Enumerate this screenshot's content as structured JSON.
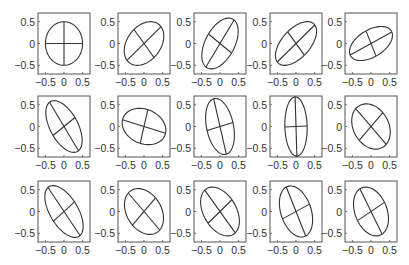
{
  "chart_data": {
    "type": "scatter",
    "title": "",
    "grid": false,
    "xlim": [
      -0.7,
      0.7
    ],
    "ylim": [
      -0.7,
      0.7
    ],
    "xticks": [
      -0.5,
      0,
      0.5
    ],
    "yticks": [
      -0.5,
      0,
      0.5
    ],
    "xtick_labels": [
      "−0.5",
      "0",
      "0.5"
    ],
    "ytick_labels": [
      "0.5",
      "0",
      "−0.5"
    ],
    "line_color": "#333333",
    "frame_color": "#555555",
    "rows": 3,
    "cols": 5,
    "panels": [
      {
        "row": 0,
        "col": 0,
        "a": 0.5,
        "b": 0.5,
        "angle_deg": 90
      },
      {
        "row": 0,
        "col": 1,
        "a": 0.6,
        "b": 0.42,
        "angle_deg": 40
      },
      {
        "row": 0,
        "col": 2,
        "a": 0.66,
        "b": 0.38,
        "angle_deg": 55
      },
      {
        "row": 0,
        "col": 3,
        "a": 0.66,
        "b": 0.35,
        "angle_deg": 40
      },
      {
        "row": 0,
        "col": 4,
        "a": 0.62,
        "b": 0.32,
        "angle_deg": 25
      },
      {
        "row": 1,
        "col": 0,
        "a": 0.68,
        "b": 0.36,
        "angle_deg": -55
      },
      {
        "row": 1,
        "col": 1,
        "a": 0.6,
        "b": 0.4,
        "angle_deg": -15
      },
      {
        "row": 1,
        "col": 2,
        "a": 0.66,
        "b": 0.36,
        "angle_deg": -75
      },
      {
        "row": 1,
        "col": 3,
        "a": 0.68,
        "b": 0.3,
        "angle_deg": -88
      },
      {
        "row": 1,
        "col": 4,
        "a": 0.58,
        "b": 0.45,
        "angle_deg": -45
      },
      {
        "row": 2,
        "col": 0,
        "a": 0.7,
        "b": 0.36,
        "angle_deg": -52
      },
      {
        "row": 2,
        "col": 1,
        "a": 0.6,
        "b": 0.44,
        "angle_deg": -45
      },
      {
        "row": 2,
        "col": 2,
        "a": 0.64,
        "b": 0.42,
        "angle_deg": -50
      },
      {
        "row": 2,
        "col": 3,
        "a": 0.62,
        "b": 0.4,
        "angle_deg": -65
      },
      {
        "row": 2,
        "col": 4,
        "a": 0.6,
        "b": 0.42,
        "angle_deg": -60
      }
    ]
  },
  "layout": {
    "col_left": [
      38,
      118,
      194,
      270,
      345
    ],
    "row_top": [
      13,
      96,
      181
    ],
    "box_w": 52,
    "box_h": 61
  }
}
